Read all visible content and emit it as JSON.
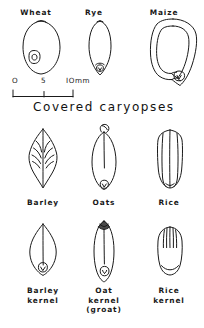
{
  "figure": {
    "heading": "Covered caryopses",
    "scale": {
      "zero_label": "O",
      "mid_label": "5",
      "max_label": "IOmm",
      "unit": "mm",
      "ticks": [
        0,
        5,
        10
      ]
    },
    "rows": [
      {
        "row_name": "covered-caryopses-top",
        "items": [
          {
            "key": "wheat",
            "label": "Wheat",
            "icon": "wheat-grain-drawing"
          },
          {
            "key": "rye",
            "label": "Rye",
            "icon": "rye-grain-drawing"
          },
          {
            "key": "maize",
            "label": "Maize",
            "icon": "maize-grain-drawing"
          }
        ]
      },
      {
        "row_name": "covered-caryopses-middle",
        "items": [
          {
            "key": "barley",
            "label": "Barley",
            "icon": "barley-grain-drawing"
          },
          {
            "key": "oats",
            "label": "Oats",
            "icon": "oat-grain-drawing"
          },
          {
            "key": "rice",
            "label": "Rice",
            "icon": "rice-grain-drawing"
          }
        ]
      },
      {
        "row_name": "kernels-bottom",
        "items": [
          {
            "key": "barley-kernel",
            "label": "Barley\nkernel",
            "line1": "Barley",
            "line2": "kernel",
            "line3": "",
            "icon": "barley-kernel-drawing"
          },
          {
            "key": "oat-kernel",
            "label": "Oat kernel (groat)",
            "line1": "Oat",
            "line2": "kernel",
            "line3": "(groat)",
            "icon": "oat-kernel-drawing"
          },
          {
            "key": "rice-kernel",
            "label": "Rice\nkernel",
            "line1": "Rice",
            "line2": "kernel",
            "line3": "",
            "icon": "rice-kernel-drawing"
          }
        ]
      }
    ],
    "colors": {
      "ink": "#1a1a1a",
      "background": "#ffffff"
    }
  }
}
